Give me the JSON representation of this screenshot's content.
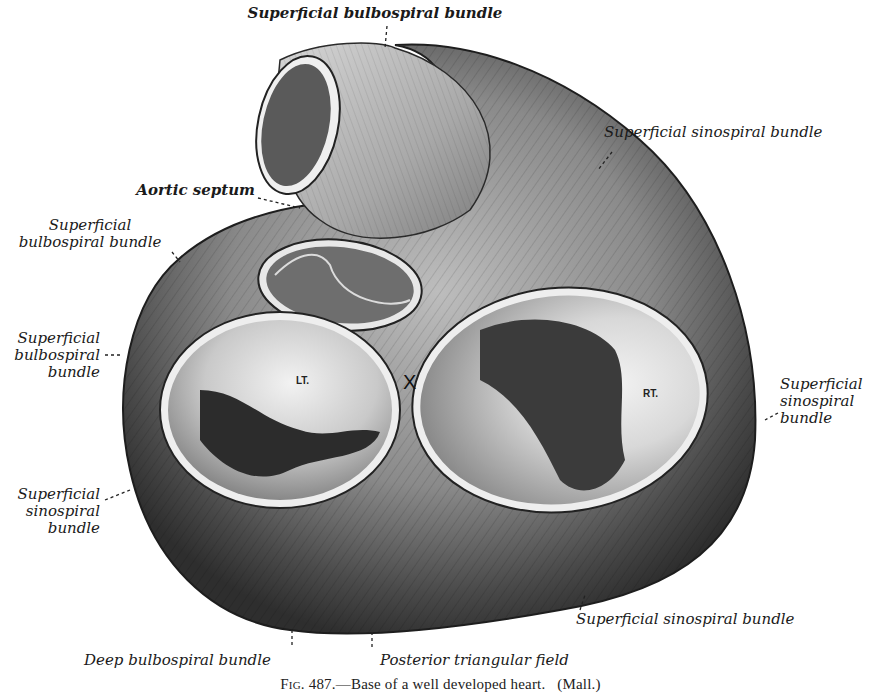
{
  "figure": {
    "caption_prefix": "Fig.",
    "caption_number": "487.",
    "caption_text": "—Base of a well developed heart.",
    "caption_credit": "(Mall.)"
  },
  "labels": {
    "top": "Superficial bulbospiral bundle",
    "upper_right": "Superficial sinospiral bundle",
    "aortic_septum": "Aortic septum",
    "left_upper": [
      "Superficial",
      "bulbospiral bundle"
    ],
    "left_middle": [
      "Superficial",
      "bulbospiral",
      "bundle"
    ],
    "left_lower": [
      "Superficial",
      "sinospiral",
      "bundle"
    ],
    "right_middle": [
      "Superficial",
      "sinospiral",
      "bundle"
    ],
    "bottom_right": "Superficial sinospiral bundle",
    "bottom_left": "Deep bulbospiral bundle",
    "bottom_center": "Posterior triangular field"
  },
  "chambers": {
    "left": "LT.",
    "right": "RT.",
    "marker": "X"
  },
  "colors": {
    "ink": "#1a1a1a",
    "muscle_dark": "#3a3a3a",
    "muscle_mid": "#7a7a7a",
    "muscle_light": "#c8c8c8",
    "orifice_light": "#ececec",
    "background": "#ffffff"
  }
}
